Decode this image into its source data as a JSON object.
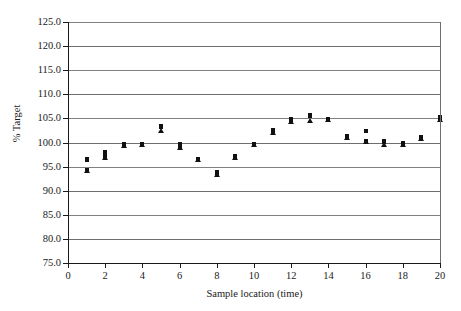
{
  "chart_data": {
    "type": "scatter",
    "title": "",
    "xlabel": "Sample location (time)",
    "ylabel": "% Target",
    "xlim": [
      0,
      20
    ],
    "ylim": [
      75.0,
      125.0
    ],
    "xticks": [
      0,
      2,
      4,
      6,
      8,
      10,
      12,
      14,
      16,
      18,
      20
    ],
    "xtick_labels": [
      "0",
      "2",
      "4",
      "6",
      "8",
      "10",
      "12",
      "14",
      "16",
      "18",
      "20"
    ],
    "yticks": [
      75.0,
      80.0,
      85.0,
      90.0,
      95.0,
      100.0,
      105.0,
      110.0,
      115.0,
      120.0,
      125.0
    ],
    "ytick_labels": [
      "75.0",
      "80.0",
      "85.0",
      "90.0",
      "95.0",
      "100.0",
      "105.0",
      "110.0",
      "115.0",
      "120.0",
      "125.0"
    ],
    "grid": true,
    "grid_axis": "y",
    "legend": false,
    "marker_color": "#111111",
    "series": [
      {
        "name": "Series 1",
        "marker": "square",
        "x": [
          1,
          2,
          3,
          4,
          5,
          6,
          7,
          8,
          9,
          10,
          11,
          12,
          13,
          14,
          15,
          16,
          17,
          18,
          19,
          20
        ],
        "values": [
          96.5,
          98.0,
          99.7,
          99.6,
          103.4,
          99.6,
          96.6,
          93.9,
          97.2,
          99.6,
          102.6,
          104.9,
          105.7,
          104.9,
          101.3,
          102.4,
          100.3,
          99.9,
          101.2,
          105.3
        ]
      },
      {
        "name": "Series 2",
        "marker": "square",
        "x": [
          1,
          2,
          3,
          4,
          5,
          6,
          7,
          8,
          9,
          10,
          11,
          12,
          13,
          14,
          15,
          16,
          17,
          18,
          19,
          20
        ],
        "values": [
          96.3,
          97.2,
          99.4,
          99.4,
          103.2,
          99.2,
          96.4,
          93.6,
          97.0,
          99.4,
          102.4,
          104.7,
          105.4,
          104.7,
          101.1,
          102.2,
          100.1,
          99.6,
          101.0,
          105.1
        ]
      },
      {
        "name": "Series 3",
        "marker": "triangle",
        "x": [
          1,
          2,
          3,
          4,
          5,
          6,
          7,
          8,
          9,
          10,
          11,
          12,
          13,
          14,
          15,
          16,
          17,
          18,
          19,
          20
        ],
        "values": [
          94.0,
          96.8,
          99.2,
          99.4,
          102.4,
          99.2,
          96.5,
          93.3,
          96.8,
          99.4,
          101.9,
          104.3,
          104.5,
          104.6,
          100.9,
          100.2,
          99.5,
          99.4,
          100.8,
          104.6
        ]
      }
    ],
    "points": [
      {
        "x": 1,
        "y": 96.5,
        "marker": "square"
      },
      {
        "x": 1,
        "y": 96.3,
        "marker": "square"
      },
      {
        "x": 1,
        "y": 94.3,
        "marker": "square"
      },
      {
        "x": 1,
        "y": 94.0,
        "marker": "triangle"
      },
      {
        "x": 2,
        "y": 98.0,
        "marker": "square"
      },
      {
        "x": 2,
        "y": 97.2,
        "marker": "square"
      },
      {
        "x": 2,
        "y": 96.8,
        "marker": "triangle"
      },
      {
        "x": 3,
        "y": 99.7,
        "marker": "square"
      },
      {
        "x": 3,
        "y": 99.4,
        "marker": "square"
      },
      {
        "x": 3,
        "y": 99.2,
        "marker": "triangle"
      },
      {
        "x": 4,
        "y": 99.6,
        "marker": "square"
      },
      {
        "x": 4,
        "y": 99.4,
        "marker": "square"
      },
      {
        "x": 4,
        "y": 99.4,
        "marker": "triangle"
      },
      {
        "x": 5,
        "y": 103.4,
        "marker": "square"
      },
      {
        "x": 5,
        "y": 103.2,
        "marker": "square"
      },
      {
        "x": 5,
        "y": 102.4,
        "marker": "triangle"
      },
      {
        "x": 6,
        "y": 99.6,
        "marker": "square"
      },
      {
        "x": 6,
        "y": 99.2,
        "marker": "square"
      },
      {
        "x": 6,
        "y": 98.9,
        "marker": "triangle"
      },
      {
        "x": 7,
        "y": 96.6,
        "marker": "square"
      },
      {
        "x": 7,
        "y": 96.4,
        "marker": "triangle"
      },
      {
        "x": 8,
        "y": 93.9,
        "marker": "square"
      },
      {
        "x": 8,
        "y": 93.6,
        "marker": "square"
      },
      {
        "x": 8,
        "y": 93.3,
        "marker": "triangle"
      },
      {
        "x": 9,
        "y": 97.2,
        "marker": "square"
      },
      {
        "x": 9,
        "y": 97.0,
        "marker": "square"
      },
      {
        "x": 9,
        "y": 96.8,
        "marker": "triangle"
      },
      {
        "x": 10,
        "y": 99.6,
        "marker": "square"
      },
      {
        "x": 10,
        "y": 99.4,
        "marker": "triangle"
      },
      {
        "x": 11,
        "y": 102.6,
        "marker": "square"
      },
      {
        "x": 11,
        "y": 102.4,
        "marker": "square"
      },
      {
        "x": 11,
        "y": 101.9,
        "marker": "triangle"
      },
      {
        "x": 12,
        "y": 104.9,
        "marker": "square"
      },
      {
        "x": 12,
        "y": 104.7,
        "marker": "square"
      },
      {
        "x": 12,
        "y": 104.3,
        "marker": "triangle"
      },
      {
        "x": 13,
        "y": 105.7,
        "marker": "square"
      },
      {
        "x": 13,
        "y": 105.4,
        "marker": "square"
      },
      {
        "x": 13,
        "y": 104.5,
        "marker": "triangle"
      },
      {
        "x": 14,
        "y": 104.9,
        "marker": "square"
      },
      {
        "x": 14,
        "y": 104.7,
        "marker": "square"
      },
      {
        "x": 14,
        "y": 104.6,
        "marker": "triangle"
      },
      {
        "x": 15,
        "y": 101.3,
        "marker": "square"
      },
      {
        "x": 15,
        "y": 101.1,
        "marker": "square"
      },
      {
        "x": 15,
        "y": 100.9,
        "marker": "triangle"
      },
      {
        "x": 16,
        "y": 102.4,
        "marker": "square"
      },
      {
        "x": 16,
        "y": 100.4,
        "marker": "square"
      },
      {
        "x": 16,
        "y": 100.2,
        "marker": "triangle"
      },
      {
        "x": 17,
        "y": 100.3,
        "marker": "square"
      },
      {
        "x": 17,
        "y": 100.1,
        "marker": "square"
      },
      {
        "x": 17,
        "y": 99.5,
        "marker": "triangle"
      },
      {
        "x": 18,
        "y": 99.9,
        "marker": "square"
      },
      {
        "x": 18,
        "y": 99.6,
        "marker": "square"
      },
      {
        "x": 18,
        "y": 99.4,
        "marker": "triangle"
      },
      {
        "x": 19,
        "y": 101.2,
        "marker": "square"
      },
      {
        "x": 19,
        "y": 101.0,
        "marker": "square"
      },
      {
        "x": 19,
        "y": 100.8,
        "marker": "triangle"
      },
      {
        "x": 20,
        "y": 105.3,
        "marker": "square"
      },
      {
        "x": 20,
        "y": 105.1,
        "marker": "square"
      },
      {
        "x": 20,
        "y": 104.6,
        "marker": "triangle"
      }
    ]
  }
}
